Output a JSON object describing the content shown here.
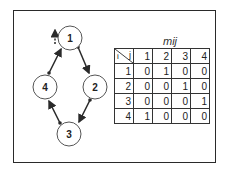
{
  "graph": {
    "nodes": [
      {
        "id": "1",
        "label": "1"
      },
      {
        "id": "2",
        "label": "2"
      },
      {
        "id": "3",
        "label": "3"
      },
      {
        "id": "4",
        "label": "4"
      }
    ],
    "edges": [
      {
        "from": "1",
        "to": "2"
      },
      {
        "from": "2",
        "to": "3"
      },
      {
        "from": "3",
        "to": "4"
      },
      {
        "from": "4",
        "to": "1"
      }
    ],
    "entry_arrow": {
      "target": "1",
      "style": "dashed"
    }
  },
  "matrix": {
    "title": "mij",
    "row_header": "i",
    "col_header": "j",
    "columns": [
      "1",
      "2",
      "3",
      "4"
    ],
    "rows": [
      {
        "label": "1",
        "values": [
          "0",
          "1",
          "0",
          "0"
        ]
      },
      {
        "label": "2",
        "values": [
          "0",
          "0",
          "1",
          "0"
        ]
      },
      {
        "label": "3",
        "values": [
          "0",
          "0",
          "0",
          "1"
        ]
      },
      {
        "label": "4",
        "values": [
          "1",
          "0",
          "0",
          "0"
        ]
      }
    ]
  },
  "colors": {
    "line": "#2a2a2a",
    "background": "#ffffff"
  }
}
